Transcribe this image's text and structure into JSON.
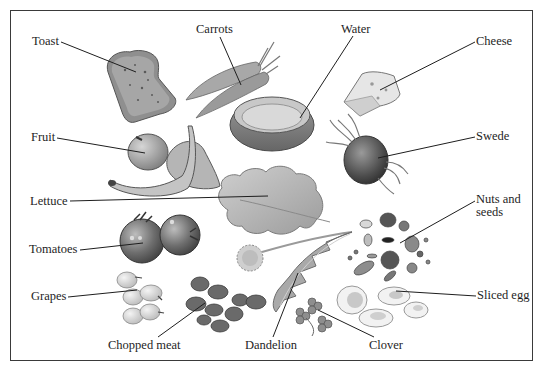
{
  "diagram": {
    "type": "labelled illustration",
    "colors": {
      "ink": "#1e1e1e",
      "frame": "#3a3a3a",
      "background": "#ffffff"
    },
    "labels": [
      {
        "id": "toast",
        "text": "Toast"
      },
      {
        "id": "carrots",
        "text": "Carrots"
      },
      {
        "id": "water",
        "text": "Water"
      },
      {
        "id": "cheese",
        "text": "Cheese"
      },
      {
        "id": "fruit",
        "text": "Fruit"
      },
      {
        "id": "swede",
        "text": "Swede"
      },
      {
        "id": "lettuce",
        "text": "Lettuce"
      },
      {
        "id": "nuts_and_seeds",
        "text": "Nuts and seeds",
        "line1": "Nuts and",
        "line2": "seeds"
      },
      {
        "id": "tomatoes",
        "text": "Tomatoes"
      },
      {
        "id": "grapes",
        "text": "Grapes"
      },
      {
        "id": "sliced_egg",
        "text": "Sliced egg"
      },
      {
        "id": "chopped_meat",
        "text": "Chopped meat"
      },
      {
        "id": "dandelion",
        "text": "Dandelion"
      },
      {
        "id": "clover",
        "text": "Clover"
      }
    ]
  }
}
